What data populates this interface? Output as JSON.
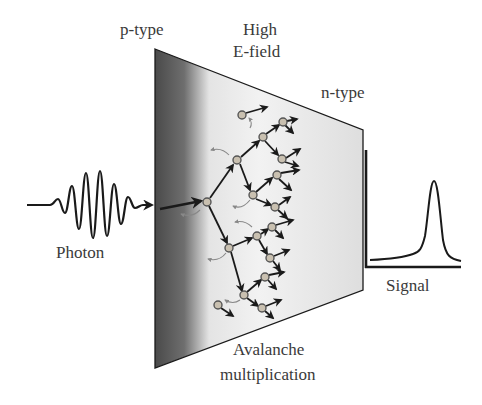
{
  "labels": {
    "p_type": "p-type",
    "high_field_1": "High",
    "high_field_2": "E-field",
    "n_type": "n-type",
    "photon": "Photon",
    "signal": "Signal",
    "avalanche_1": "Avalanche",
    "avalanche_2": "multiplication"
  },
  "colors": {
    "stroke": "#1a1a1a",
    "text": "#3a3a3a",
    "p_region": "#5a5a5a",
    "depletion": "#d8d8d8",
    "node_fill": "#c9c0b0",
    "backscatter": "#888888"
  },
  "diagram": {
    "trapezoid": {
      "left_x": 155,
      "left_top": 49,
      "left_bottom": 368,
      "right_x": 363,
      "right_top": 130,
      "right_bottom": 290
    },
    "photon_baseline_y": 205,
    "signal_axes": {
      "x": 366,
      "top": 150,
      "bottom": 267,
      "right": 461
    },
    "nodes": [
      [
        207,
        202
      ],
      [
        237,
        160
      ],
      [
        263,
        137
      ],
      [
        283,
        122
      ],
      [
        242,
        115
      ],
      [
        282,
        159
      ],
      [
        277,
        175
      ],
      [
        253,
        195
      ],
      [
        275,
        207
      ],
      [
        229,
        248
      ],
      [
        257,
        236
      ],
      [
        272,
        227
      ],
      [
        270,
        258
      ],
      [
        244,
        295
      ],
      [
        265,
        277
      ],
      [
        262,
        308
      ],
      [
        218,
        305
      ]
    ]
  }
}
